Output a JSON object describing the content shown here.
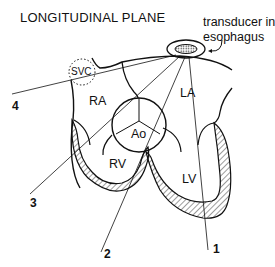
{
  "figure": {
    "title": "LONGITUDINAL PLANE",
    "transducer_label_line1": "transducer in",
    "transducer_label_line2": "esophagus",
    "structures": {
      "svc": "SVC",
      "ra": "RA",
      "la": "LA",
      "ao": "Ao",
      "rv": "RV",
      "lv": "LV"
    },
    "scan_lines": {
      "line1": "1",
      "line2": "2",
      "line3": "3",
      "line4": "4"
    },
    "colors": {
      "ink": "#111111",
      "background": "#ffffff"
    }
  }
}
